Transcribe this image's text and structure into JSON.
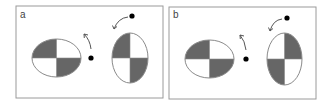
{
  "figure": {
    "colors": {
      "background": "#ffffff",
      "frame": "#9a9a9a",
      "outline": "#8a8a8a",
      "fill_dark": "#666666",
      "fill_light": "#ffffff",
      "dot": "#000000",
      "arrow": "#555555",
      "label": "#444444"
    },
    "panels": [
      {
        "label": "a",
        "frame": {
          "x": 16,
          "y": 6,
          "width": 147,
          "height": 92
        },
        "label_pos": {
          "x": 20,
          "y": 18
        },
        "ellipses": [
          {
            "name": "horizontal-ellipse",
            "cx": 56.5,
            "cy": 58,
            "rx": 24.5,
            "ry": 19,
            "dark_quadrants": [
              "top-left",
              "bottom-right"
            ]
          },
          {
            "name": "vertical-ellipse",
            "cx": 130,
            "cy": 58,
            "rx": 18,
            "ry": 25,
            "dark_quadrants": [
              "top-left",
              "bottom-right"
            ]
          }
        ],
        "dots": [
          {
            "name": "center-dot",
            "cx": 91,
            "cy": 58,
            "r": 2.6
          },
          {
            "name": "top-dot",
            "cx": 132,
            "cy": 16,
            "r": 2.6
          }
        ],
        "arrows": [
          {
            "name": "arrow-up-left",
            "path": "M 91 49 Q 90 40 84 34",
            "head": {
              "x": 84,
              "y": 34,
              "angle": 225
            }
          },
          {
            "name": "arrow-down-left",
            "path": "M 128 17 Q 118 18 114 29",
            "head": {
              "x": 114,
              "y": 29,
              "angle": 110
            }
          }
        ]
      },
      {
        "label": "b",
        "frame": {
          "x": 169,
          "y": 7,
          "width": 147,
          "height": 92
        },
        "label_pos": {
          "x": 173,
          "y": 18
        },
        "ellipses": [
          {
            "name": "horizontal-ellipse",
            "cx": 209.5,
            "cy": 59,
            "rx": 24.5,
            "ry": 19,
            "dark_quadrants": [
              "top-left",
              "bottom-right"
            ]
          },
          {
            "name": "vertical-ellipse",
            "cx": 284.5,
            "cy": 59,
            "rx": 17.5,
            "ry": 26,
            "dark_quadrants": [
              "top-right",
              "bottom-left"
            ]
          }
        ],
        "dots": [
          {
            "name": "center-dot",
            "cx": 246,
            "cy": 59,
            "r": 2.6
          },
          {
            "name": "top-dot",
            "cx": 287,
            "cy": 18,
            "r": 2.6
          }
        ],
        "arrows": [
          {
            "name": "arrow-up-left",
            "path": "M 246 50 Q 245 41 240 35",
            "head": {
              "x": 240,
              "y": 35,
              "angle": 225
            }
          },
          {
            "name": "arrow-down-left",
            "path": "M 282 19 Q 273 20 270 31",
            "head": {
              "x": 270,
              "y": 31,
              "angle": 110
            }
          }
        ]
      }
    ]
  }
}
